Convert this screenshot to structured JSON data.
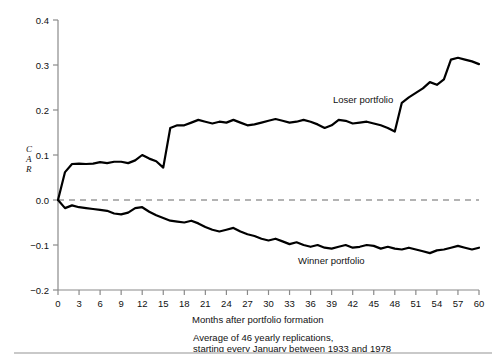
{
  "figure": {
    "title": "",
    "y_axis_label_letters": [
      "C",
      "A",
      "R"
    ],
    "x_axis_title": "Months after portfolio formation",
    "caption_line1": "Average of 46 yearly replications,",
    "caption_line2": "starting every January between 1933 and 1978",
    "series_labels": {
      "loser": "Loser portfolio",
      "winner": "Winner portfolio"
    },
    "colors": {
      "line": "#000000",
      "zero_line": "#999999",
      "axis": "#808080",
      "text": "#111111",
      "background": "#ffffff",
      "rule": "#c9c9c9"
    }
  },
  "chart_data": {
    "type": "line",
    "title": "",
    "xlabel": "Months after portfolio formation",
    "ylabel": "CAR",
    "xlim": [
      0,
      60
    ],
    "ylim": [
      -0.2,
      0.4
    ],
    "grid": false,
    "legend_position": "inline-annotation",
    "yticks": [
      -0.2,
      -0.1,
      0.0,
      0.1,
      0.2,
      0.3,
      0.4
    ],
    "ytick_labels": [
      "-0.2",
      "-0.1",
      "0.0",
      "0.1",
      "0.2",
      "0.3",
      "0.4"
    ],
    "xticks": [
      0,
      3,
      6,
      9,
      12,
      15,
      18,
      21,
      24,
      27,
      30,
      33,
      36,
      39,
      42,
      45,
      48,
      51,
      54,
      57,
      60
    ],
    "xtick_labels": [
      "0",
      "3",
      "6",
      "9",
      "12",
      "15",
      "18",
      "21",
      "24",
      "27",
      "30",
      "33",
      "36",
      "39",
      "42",
      "45",
      "48",
      "51",
      "54",
      "57",
      "60"
    ],
    "zero_reference_line": 0.0,
    "x": [
      0,
      1,
      2,
      3,
      4,
      5,
      6,
      7,
      8,
      9,
      10,
      11,
      12,
      13,
      14,
      15,
      16,
      17,
      18,
      19,
      20,
      21,
      22,
      23,
      24,
      25,
      26,
      27,
      28,
      29,
      30,
      31,
      32,
      33,
      34,
      35,
      36,
      37,
      38,
      39,
      40,
      41,
      42,
      43,
      44,
      45,
      46,
      47,
      48,
      49,
      50,
      51,
      52,
      53,
      54,
      55,
      56,
      57,
      58,
      59,
      60
    ],
    "series": [
      {
        "name": "Loser portfolio",
        "annotation": "Loser portfolio",
        "values": [
          0.0,
          0.062,
          0.08,
          0.081,
          0.08,
          0.081,
          0.084,
          0.082,
          0.085,
          0.085,
          0.082,
          0.088,
          0.1,
          0.092,
          0.086,
          0.072,
          0.16,
          0.166,
          0.166,
          0.172,
          0.178,
          0.174,
          0.17,
          0.174,
          0.172,
          0.178,
          0.172,
          0.166,
          0.168,
          0.172,
          0.176,
          0.18,
          0.176,
          0.172,
          0.174,
          0.178,
          0.174,
          0.168,
          0.16,
          0.166,
          0.178,
          0.176,
          0.17,
          0.172,
          0.174,
          0.17,
          0.166,
          0.16,
          0.152,
          0.216,
          0.228,
          0.238,
          0.248,
          0.262,
          0.256,
          0.268,
          0.312,
          0.316,
          0.312,
          0.308,
          0.302
        ]
      },
      {
        "name": "Winner portfolio",
        "annotation": "Winner portfolio",
        "values": [
          0.0,
          -0.018,
          -0.012,
          -0.016,
          -0.018,
          -0.02,
          -0.022,
          -0.024,
          -0.03,
          -0.032,
          -0.028,
          -0.018,
          -0.016,
          -0.026,
          -0.034,
          -0.04,
          -0.046,
          -0.048,
          -0.05,
          -0.046,
          -0.052,
          -0.06,
          -0.066,
          -0.07,
          -0.066,
          -0.062,
          -0.07,
          -0.076,
          -0.08,
          -0.086,
          -0.09,
          -0.086,
          -0.092,
          -0.098,
          -0.094,
          -0.1,
          -0.104,
          -0.1,
          -0.106,
          -0.108,
          -0.104,
          -0.1,
          -0.106,
          -0.104,
          -0.1,
          -0.102,
          -0.108,
          -0.104,
          -0.108,
          -0.11,
          -0.106,
          -0.11,
          -0.114,
          -0.118,
          -0.112,
          -0.11,
          -0.106,
          -0.102,
          -0.106,
          -0.11,
          -0.106
        ]
      }
    ]
  }
}
